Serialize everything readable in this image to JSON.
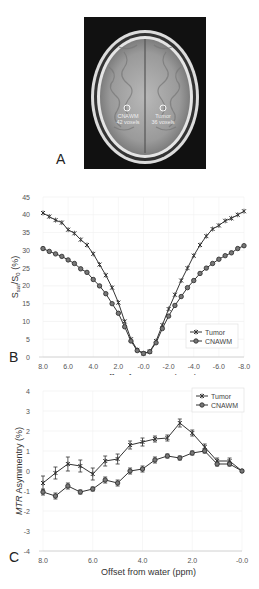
{
  "panel_a": {
    "label": "A",
    "roi_left": {
      "name": "CNAWM",
      "voxels": "42 voxels"
    },
    "roi_right": {
      "name": "Tumor",
      "voxels": "36 voxels"
    }
  },
  "panel_b": {
    "label": "B"
  },
  "panel_c": {
    "label": "C"
  },
  "chart_data": [
    {
      "type": "line",
      "panel": "B",
      "title": "",
      "xlabel": "Offset from water (ppm)",
      "ylabel": "Ssat/S0 (%)",
      "x_ticks": [
        "8.0",
        "6.0",
        "4.0",
        "2.0",
        "-0.0",
        "-2.0",
        "-4.0",
        "-6.0",
        "-8.0"
      ],
      "y_ticks": [
        "0",
        "5",
        "10",
        "15",
        "20",
        "25",
        "30",
        "35",
        "40",
        "45"
      ],
      "xlim": [
        8,
        -8
      ],
      "ylim": [
        0,
        45
      ],
      "grid": true,
      "legend_position": "lower right",
      "x": [
        8.0,
        7.5,
        7.0,
        6.5,
        6.0,
        5.5,
        5.0,
        4.5,
        4.0,
        3.5,
        3.0,
        2.5,
        2.0,
        1.5,
        1.0,
        0.5,
        0.0,
        -0.5,
        -1.0,
        -1.5,
        -2.0,
        -2.5,
        -3.0,
        -3.5,
        -4.0,
        -4.5,
        -5.0,
        -5.5,
        -6.0,
        -6.5,
        -7.0,
        -7.5,
        -8.0
      ],
      "series": [
        {
          "name": "Tumor",
          "marker": "x",
          "values": [
            40.5,
            39.5,
            38.5,
            37.8,
            35.8,
            34.8,
            33.0,
            31.5,
            29.0,
            26.0,
            23.0,
            19.5,
            15.3,
            10.0,
            5.0,
            2.0,
            1.0,
            1.5,
            4.5,
            9.0,
            13.5,
            17.5,
            21.5,
            25.0,
            28.5,
            31.5,
            34.0,
            36.0,
            37.0,
            38.3,
            39.0,
            40.0,
            41.0
          ]
        },
        {
          "name": "CNAWM",
          "marker": "o",
          "values": [
            30.5,
            29.7,
            29.0,
            28.3,
            27.3,
            26.3,
            24.8,
            23.8,
            21.8,
            20.0,
            17.8,
            15.0,
            12.3,
            8.5,
            4.5,
            1.8,
            1.0,
            1.5,
            4.0,
            8.0,
            11.5,
            14.5,
            17.0,
            19.5,
            21.5,
            23.5,
            25.0,
            26.3,
            27.5,
            28.5,
            29.3,
            30.5,
            31.3
          ]
        }
      ]
    },
    {
      "type": "line",
      "panel": "C",
      "title": "",
      "xlabel": "Offset from water (ppm)",
      "ylabel": "MTR Asymmentry (%)",
      "x_ticks": [
        "8.0",
        "6.0",
        "4.0",
        "2.0",
        "-0.0"
      ],
      "y_ticks": [
        "-4",
        "-3",
        "-2",
        "-1",
        "0",
        "1",
        "2",
        "3",
        "4"
      ],
      "xlim": [
        8,
        0
      ],
      "ylim": [
        -4,
        4
      ],
      "grid": true,
      "error_bars": true,
      "legend_position": "upper right",
      "x": [
        8.0,
        7.5,
        7.0,
        6.5,
        6.0,
        5.5,
        5.0,
        4.5,
        4.0,
        3.5,
        3.0,
        2.5,
        2.0,
        1.5,
        1.0,
        0.5,
        0.0
      ],
      "series": [
        {
          "name": "Tumor",
          "marker": "x",
          "values": [
            -0.6,
            -0.1,
            0.35,
            0.25,
            -0.15,
            0.5,
            0.6,
            1.3,
            1.45,
            1.6,
            1.65,
            2.4,
            1.9,
            1.2,
            0.5,
            0.5,
            0.0
          ],
          "errors": [
            0.35,
            0.3,
            0.35,
            0.3,
            0.3,
            0.25,
            0.25,
            0.2,
            0.2,
            0.15,
            0.15,
            0.2,
            0.15,
            0.15,
            0.15,
            0.15,
            0.05
          ]
        },
        {
          "name": "CNAWM",
          "marker": "o",
          "values": [
            -1.05,
            -1.25,
            -0.75,
            -1.05,
            -0.9,
            -0.45,
            -0.6,
            0.0,
            0.1,
            0.55,
            0.75,
            0.65,
            0.9,
            1.0,
            0.35,
            0.35,
            0.0
          ],
          "errors": [
            0.15,
            0.15,
            0.15,
            0.1,
            0.1,
            0.15,
            0.15,
            0.15,
            0.15,
            0.15,
            0.1,
            0.1,
            0.1,
            0.1,
            0.1,
            0.1,
            0.05
          ]
        }
      ]
    }
  ]
}
